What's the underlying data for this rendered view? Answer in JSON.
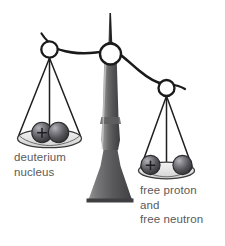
{
  "figure": {
    "background_color": "#ffffff",
    "width": 225,
    "height": 246
  },
  "labels": {
    "left_pan": {
      "line1": "deuterium",
      "line2": "nucleus"
    },
    "right_pan": {
      "line1": "free proton",
      "line2": "and",
      "line3": "free neutron"
    },
    "text_color": "#5a5a5a"
  },
  "scale": {
    "state": "tilted-right",
    "fulcrum": {
      "name": "balance-stand",
      "column_color_light": "#b9b9b9",
      "column_color_dark": "#4a4a4a",
      "pointer_color": "#222222"
    },
    "beam": {
      "name": "balance-beam",
      "color": "#1a1a1a",
      "stroke_width": 2.4
    },
    "rings": {
      "color": "#1a1a1a",
      "fill": "#ffffff"
    },
    "pans": {
      "fill": "#e8e8e8",
      "stroke": "#3a3a3a"
    }
  },
  "particles": {
    "proton_symbol": "+",
    "neutron_symbol": "",
    "sphere_dark": "#4e4e52",
    "sphere_light": "#a8a8ad",
    "sphere_edge": "#2c2c30",
    "left_pan_particles": [
      {
        "name": "proton",
        "charge": "+",
        "bound": true
      },
      {
        "name": "neutron",
        "charge": "",
        "bound": true
      }
    ],
    "right_pan_particles": [
      {
        "name": "proton",
        "charge": "+",
        "bound": false
      },
      {
        "name": "neutron",
        "charge": "",
        "bound": false
      }
    ]
  }
}
